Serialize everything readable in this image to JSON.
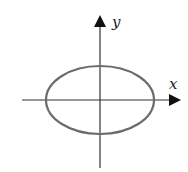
{
  "diagram": {
    "type": "ellipse-on-axes",
    "x_axis_label": "x",
    "y_axis_label": "y",
    "ellipse": {
      "cx": 100,
      "cy": 100,
      "rx": 54,
      "ry": 34,
      "stroke": "#6b6b6b"
    },
    "axis_color": "#333333"
  }
}
